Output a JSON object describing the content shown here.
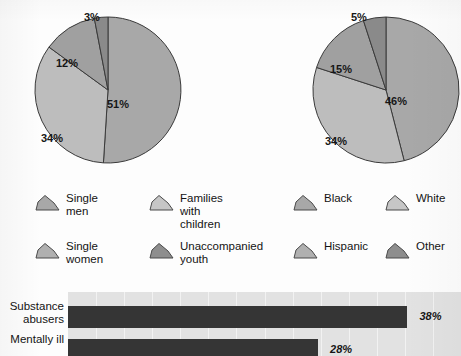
{
  "chart_data": [
    {
      "type": "pie",
      "name": "homeless-population-by-household-type",
      "title": "",
      "labels": [
        "Single men",
        "Single women",
        "Families with children",
        "Unaccompanied youth"
      ],
      "values": [
        51,
        34,
        12,
        3
      ],
      "value_labels": [
        "51%",
        "34%",
        "12%",
        "3%"
      ],
      "colors": [
        "#a8a8a8",
        "#bdbdbd",
        "#a0a0a0",
        "#8a8a8a"
      ],
      "start_angle_deg": 0,
      "direction": "clockwise",
      "legend_position": "below"
    },
    {
      "type": "pie",
      "name": "homeless-population-by-race",
      "title": "",
      "labels": [
        "Black",
        "White",
        "Hispanic",
        "Other"
      ],
      "values": [
        46,
        34,
        15,
        5
      ],
      "value_labels": [
        "46%",
        "34%",
        "15%",
        "5%"
      ],
      "colors": [
        "#a8a8a8",
        "#bdbdbd",
        "#a0a0a0",
        "#8a8a8a"
      ],
      "start_angle_deg": 0,
      "direction": "clockwise",
      "legend_position": "below"
    },
    {
      "type": "bar",
      "name": "homeless-population-by-condition",
      "orientation": "horizontal",
      "title": "",
      "categories": [
        "Substance abusers",
        "Mentally ill"
      ],
      "values": [
        38,
        28
      ],
      "value_labels": [
        "38%",
        "28%"
      ],
      "xlim": [
        0,
        44
      ],
      "xlabel": "",
      "ylabel": "",
      "grid": true,
      "bar_color": "#353535",
      "plot_background": "#e2e2e2"
    }
  ],
  "pies": [
    {
      "id": "pie-household",
      "slices": [
        {
          "label": "51%",
          "value": 51,
          "color": "#a8a8a8",
          "lx": 107,
          "ly": 98
        },
        {
          "label": "34%",
          "value": 34,
          "color": "#bdbdbd",
          "lx": 41,
          "ly": 132
        },
        {
          "label": "12%",
          "value": 12,
          "color": "#a0a0a0",
          "lx": 56,
          "ly": 57
        },
        {
          "label": "3%",
          "value": 3,
          "color": "#8a8a8a",
          "lx": 84,
          "ly": 11
        }
      ]
    },
    {
      "id": "pie-race",
      "slices": [
        {
          "label": "46%",
          "value": 46,
          "color": "#a8a8a8",
          "lx": 385,
          "ly": 95
        },
        {
          "label": "34%",
          "value": 34,
          "color": "#bdbdbd",
          "lx": 325,
          "ly": 135
        },
        {
          "label": "15%",
          "value": 15,
          "color": "#a0a0a0",
          "lx": 330,
          "ly": 63
        },
        {
          "label": "5%",
          "value": 5,
          "color": "#8a8a8a",
          "lx": 351,
          "ly": 11
        }
      ]
    }
  ],
  "legends": {
    "household": [
      {
        "label": "Single\nmen",
        "color": "#a8a8a8"
      },
      {
        "label": "Families\nwith children",
        "color": "#c6c6c6"
      },
      {
        "label": "Single\nwomen",
        "color": "#b0b0b0"
      },
      {
        "label": "Unaccompanied\nyouth",
        "color": "#8e8e8e"
      }
    ],
    "race": [
      {
        "label": "Black",
        "color": "#a8a8a8"
      },
      {
        "label": "White",
        "color": "#c6c6c6"
      },
      {
        "label": "Hispanic",
        "color": "#b0b0b0"
      },
      {
        "label": "Other",
        "color": "#8e8e8e"
      }
    ]
  },
  "bar_chart": {
    "rows": [
      {
        "category": "Substance\nabusers",
        "value": 38,
        "value_label": "38%"
      },
      {
        "category": "Mentally ill",
        "value": 28,
        "value_label": "28%"
      }
    ],
    "max": 44
  },
  "colors": {
    "slice_primary": "#a8a8a8",
    "slice_light": "#bdbdbd",
    "slice_mid": "#a0a0a0",
    "slice_dark": "#8a8a8a",
    "bar": "#353535",
    "plot_bg": "#e2e2e2",
    "page_bg": "#fdfdfd",
    "text": "#161616"
  }
}
